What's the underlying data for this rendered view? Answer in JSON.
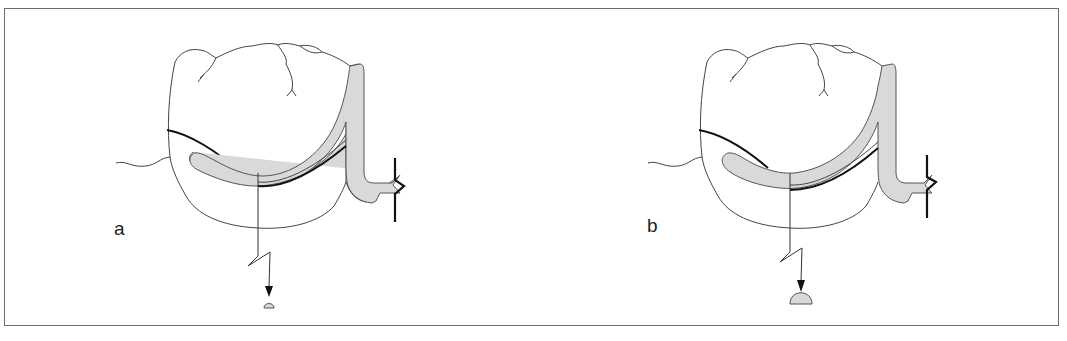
{
  "figure": {
    "type": "dental illustration",
    "panels": [
      {
        "id": "a",
        "label": "a",
        "dome_size": "small"
      },
      {
        "id": "b",
        "label": "b",
        "dome_size": "large"
      }
    ],
    "colors": {
      "frame": "#6e6e6e",
      "clasp_fill": "#d9d9d9",
      "line": "#444444",
      "emphasis_line": "#111111"
    }
  }
}
